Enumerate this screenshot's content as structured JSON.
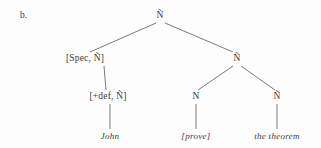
{
  "figure": {
    "item_label": "b.",
    "background_color": "#fdfdfd",
    "line_color": "#6b6b6b",
    "text_color": "#3a3a3a"
  },
  "tree": {
    "nodes": [
      {
        "id": "root",
        "label": "Ñ",
        "x": 160,
        "y": 16
      },
      {
        "id": "spec",
        "label": "[Spec, Ñ]",
        "x": 85,
        "y": 59
      },
      {
        "id": "nbar_right",
        "label": "Ñ",
        "x": 237,
        "y": 59
      },
      {
        "id": "def",
        "label": "[+def, Ñ]",
        "x": 108,
        "y": 97
      },
      {
        "id": "n_prove",
        "label": "N",
        "x": 196,
        "y": 97
      },
      {
        "id": "nbar_theorem",
        "label": "Ñ",
        "x": 277,
        "y": 97
      }
    ],
    "leaves": [
      {
        "id": "john",
        "label": "John",
        "x": 110,
        "y": 136
      },
      {
        "id": "prove",
        "label": "[prove]",
        "x": 196,
        "y": 136
      },
      {
        "id": "theorem",
        "label": "the theorem",
        "x": 277,
        "y": 136
      }
    ],
    "edges": [
      {
        "from": "root",
        "to": "spec",
        "x1": 156,
        "y1": 23,
        "x2": 90,
        "y2": 52
      },
      {
        "from": "root",
        "to": "nbar_right",
        "x1": 165,
        "y1": 23,
        "x2": 233,
        "y2": 52
      },
      {
        "from": "spec",
        "to": "def",
        "x1": 104,
        "y1": 66,
        "x2": 106,
        "y2": 90
      },
      {
        "from": "def",
        "to": "john",
        "x1": 110,
        "y1": 104,
        "x2": 110,
        "y2": 129
      },
      {
        "from": "nbar_right",
        "to": "n_prove",
        "x1": 233,
        "y1": 66,
        "x2": 198,
        "y2": 90
      },
      {
        "from": "nbar_right",
        "to": "nbar_theorem",
        "x1": 241,
        "y1": 66,
        "x2": 275,
        "y2": 90
      },
      {
        "from": "n_prove",
        "to": "prove",
        "x1": 196,
        "y1": 104,
        "x2": 196,
        "y2": 129
      },
      {
        "from": "nbar_theorem",
        "to": "theorem",
        "x1": 277,
        "y1": 104,
        "x2": 277,
        "y2": 129
      }
    ]
  }
}
